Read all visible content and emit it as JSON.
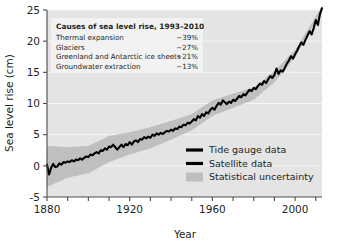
{
  "chart_data": {
    "type": "line",
    "title": "",
    "xlabel": "Year",
    "ylabel": "Sea level rise (cm)",
    "xlim": [
      1880,
      2013
    ],
    "ylim": [
      -5,
      25
    ],
    "xticks": [
      1880,
      1890,
      1900,
      1910,
      1920,
      1930,
      1940,
      1950,
      1960,
      1970,
      1980,
      1990,
      2000,
      2010
    ],
    "xtick_labels": [
      "1880",
      "",
      "",
      "",
      "1920",
      "",
      "",
      "",
      "1960",
      "",
      "",
      "",
      "2000",
      ""
    ],
    "yticks": [
      -5,
      0,
      5,
      10,
      15,
      20,
      25
    ],
    "ytick_labels": [
      "-5",
      "0",
      "5",
      "10",
      "15",
      "20",
      "25"
    ],
    "grid": "horizontal-white",
    "legend_position": "bottom-right",
    "colors": {
      "line": "#000000",
      "band": "#b9b9b9",
      "panel": "#e4e4e4",
      "gridline": "#f6f6f6",
      "axis": "#4a4a4a",
      "text": "#231f20",
      "annotation_box": "#f2f2f2"
    },
    "series": [
      {
        "name": "Tide gauge data",
        "type": "line",
        "x": [
          1880,
          1881,
          1882,
          1883,
          1884,
          1885,
          1886,
          1887,
          1888,
          1889,
          1890,
          1891,
          1892,
          1893,
          1894,
          1895,
          1896,
          1897,
          1898,
          1899,
          1900,
          1901,
          1902,
          1903,
          1904,
          1905,
          1906,
          1907,
          1908,
          1909,
          1910,
          1911,
          1912,
          1913,
          1914,
          1915,
          1916,
          1917,
          1918,
          1919,
          1920,
          1921,
          1922,
          1923,
          1924,
          1925,
          1926,
          1927,
          1928,
          1929,
          1930,
          1931,
          1932,
          1933,
          1934,
          1935,
          1936,
          1937,
          1938,
          1939,
          1940,
          1941,
          1942,
          1943,
          1944,
          1945,
          1946,
          1947,
          1948,
          1949,
          1950,
          1951,
          1952,
          1953,
          1954,
          1955,
          1956,
          1957,
          1958,
          1959,
          1960,
          1961,
          1962,
          1963,
          1964,
          1965,
          1966,
          1967,
          1968,
          1969,
          1970,
          1971,
          1972,
          1973,
          1974,
          1975,
          1976,
          1977,
          1978,
          1979,
          1980,
          1981,
          1982,
          1983,
          1984,
          1985,
          1986,
          1987,
          1988,
          1989,
          1990,
          1991,
          1992
        ],
        "y": [
          0.2,
          -1.4,
          -0.3,
          0.3,
          -0.2,
          -0.1,
          0.4,
          0.2,
          0.6,
          0.5,
          0.7,
          0.6,
          0.9,
          0.7,
          1.0,
          0.9,
          1.2,
          1.0,
          1.3,
          1.5,
          1.4,
          1.8,
          1.7,
          2.0,
          2.2,
          2.0,
          2.5,
          2.4,
          2.8,
          2.6,
          3.1,
          3.0,
          3.4,
          3.0,
          2.6,
          3.0,
          3.4,
          3.0,
          3.5,
          3.3,
          3.8,
          3.4,
          3.9,
          4.1,
          3.8,
          4.3,
          4.2,
          4.6,
          4.4,
          4.7,
          4.5,
          5.0,
          4.8,
          5.2,
          5.0,
          5.3,
          5.1,
          5.4,
          5.6,
          5.5,
          5.8,
          5.6,
          6.0,
          5.9,
          6.3,
          6.2,
          6.6,
          6.5,
          6.9,
          6.8,
          7.1,
          7.5,
          7.3,
          8.0,
          7.7,
          8.3,
          8.0,
          8.6,
          8.4,
          9.0,
          9.3,
          9.0,
          9.6,
          10.1,
          9.8,
          10.5,
          10.2,
          9.9,
          10.3,
          10.1,
          10.6,
          10.4,
          10.8,
          11.2,
          11.0,
          11.5,
          11.3,
          11.8,
          12.2,
          12.0,
          12.5,
          12.3,
          12.8,
          13.2,
          13.0,
          13.6,
          13.3,
          13.9,
          14.4,
          14.1,
          14.6,
          15.6,
          14.8
        ]
      },
      {
        "name": "Satellite data",
        "type": "line",
        "x": [
          1992,
          1993,
          1994,
          1995,
          1996,
          1997,
          1998,
          1999,
          2000,
          2001,
          2002,
          2003,
          2004,
          2005,
          2006,
          2007,
          2008,
          2009,
          2010,
          2011,
          2012,
          2013
        ],
        "y": [
          14.8,
          15.3,
          15.1,
          15.7,
          16.4,
          16.9,
          17.6,
          17.2,
          17.9,
          18.5,
          19.2,
          19.8,
          19.4,
          20.2,
          20.9,
          21.6,
          21.1,
          22.1,
          23.4,
          22.6,
          24.3,
          25.3
        ]
      }
    ],
    "uncertainty_band": {
      "name": "Statistical uncertainty",
      "x": [
        1880,
        1890,
        1900,
        1910,
        1920,
        1930,
        1940,
        1950,
        1960,
        1970,
        1980,
        1990,
        2000,
        2013
      ],
      "lower": [
        -3.4,
        -1.9,
        -1.2,
        0.6,
        1.8,
        2.8,
        4.2,
        5.7,
        8.0,
        9.3,
        10.6,
        13.4,
        17.4,
        24.9
      ],
      "upper": [
        3.2,
        3.0,
        3.2,
        4.8,
        5.4,
        6.2,
        7.2,
        8.3,
        10.5,
        11.6,
        12.6,
        15.2,
        18.6,
        25.6
      ]
    },
    "annotation": {
      "title": "Causes of sea level rise, 1993–2010",
      "rows": [
        {
          "label": "Thermal expansion",
          "value": "~39%"
        },
        {
          "label": "Glaciers",
          "value": "~27%"
        },
        {
          "label": "Greenland and Antarctic ice sheets",
          "value": "~21%"
        },
        {
          "label": "Groundwater extraction",
          "value": "~13%"
        }
      ]
    },
    "legend": [
      {
        "label": "Tide gauge data",
        "marker": "line",
        "color": "#000000"
      },
      {
        "label": "Satellite data",
        "marker": "line",
        "color": "#000000"
      },
      {
        "label": "Statistical uncertainty",
        "marker": "band",
        "color": "#b9b9b9"
      }
    ]
  }
}
